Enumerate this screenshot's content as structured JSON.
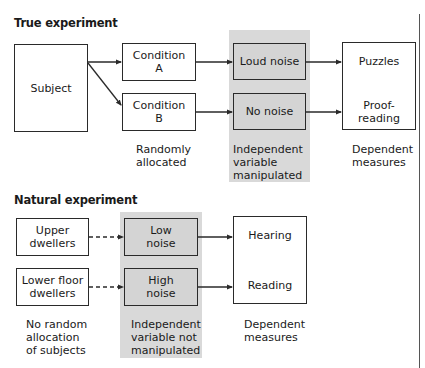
{
  "true_experiment": {
    "title": "True experiment",
    "subject": "Subject",
    "conditions": [
      {
        "line1": "Condition",
        "line2": "A"
      },
      {
        "line1": "Condition",
        "line2": "B"
      }
    ],
    "conditions_caption": [
      "Randomly",
      "allocated"
    ],
    "iv_levels": [
      "Loud noise",
      "No noise"
    ],
    "iv_caption": [
      "Independent",
      "variable",
      "manipulated"
    ],
    "dependent": [
      {
        "line1": "Puzzles",
        "line2": ""
      },
      {
        "line1": "Proof-",
        "line2": "reading"
      }
    ],
    "dependent_caption": [
      "Dependent",
      "measures"
    ]
  },
  "natural_experiment": {
    "title": "Natural experiment",
    "groups": [
      {
        "line1": "Upper",
        "line2": "dwellers"
      },
      {
        "line1": "Lower floor",
        "line2": "dwellers"
      }
    ],
    "groups_caption": [
      "No random",
      "allocation",
      "of subjects"
    ],
    "iv_levels": [
      {
        "line1": "Low",
        "line2": "noise"
      },
      {
        "line1": "High",
        "line2": "noise"
      }
    ],
    "iv_caption": [
      "Independent",
      "variable not",
      "manipulated"
    ],
    "dependent": [
      "Hearing",
      "Reading"
    ],
    "dependent_caption": [
      "Dependent",
      "measures"
    ]
  },
  "colors": {
    "shade": "#d9d9d9",
    "box_grey": "#d4d4d4",
    "stroke": "#2a2a2a"
  }
}
